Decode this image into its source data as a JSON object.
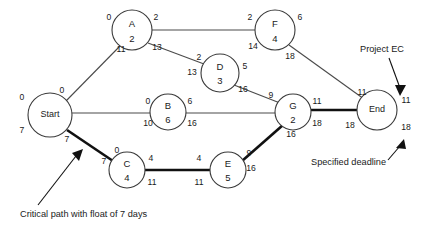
{
  "diagram": {
    "type": "activity-on-node-network",
    "nodes": [
      {
        "id": "start",
        "name": "Start",
        "duration": "",
        "cx": 50,
        "cy": 115,
        "r": 22,
        "early_start": "0",
        "early_finish": "0",
        "late_start": "7",
        "late_finish": "7",
        "corners": {
          "tl": "0",
          "tr": "0",
          "bl": "7",
          "br": "7"
        },
        "critical": true
      },
      {
        "id": "a",
        "name": "A",
        "duration": "2",
        "cx": 132,
        "cy": 30,
        "r": 20,
        "early_start": "0",
        "early_finish": "2",
        "late_start": "11",
        "late_finish": "13",
        "corners": {
          "tl": "0",
          "tr": "2",
          "bl": "11",
          "br": "13"
        },
        "critical": false
      },
      {
        "id": "b",
        "name": "B",
        "duration": "6",
        "cx": 168,
        "cy": 112,
        "r": 18,
        "early_start": "0",
        "early_finish": "6",
        "late_start": "10",
        "late_finish": "16",
        "corners": {
          "tl": "0",
          "tr": "6",
          "bl": "10",
          "br": "16"
        },
        "critical": false
      },
      {
        "id": "c",
        "name": "C",
        "duration": "4",
        "cx": 127,
        "cy": 170,
        "r": 18,
        "early_start": "0",
        "early_finish": "4",
        "late_start": "7",
        "late_finish": "11",
        "corners": {
          "tl": "0",
          "tr": "4",
          "bl": "7",
          "br": "11"
        },
        "critical": true
      },
      {
        "id": "d",
        "name": "D",
        "duration": "3",
        "cx": 220,
        "cy": 73,
        "r": 19,
        "early_start": "2",
        "early_finish": "5",
        "late_start": "13",
        "late_finish": "16",
        "corners": {
          "tl": "2",
          "tr": "5",
          "bl": "13",
          "br": "16"
        },
        "critical": false
      },
      {
        "id": "e",
        "name": "E",
        "duration": "5",
        "cx": 228,
        "cy": 170,
        "r": 18,
        "early_start": "4",
        "early_finish": "9",
        "late_start": "11",
        "late_finish": "16",
        "corners": {
          "tl": "4",
          "tr": "9",
          "bl": "11",
          "br": "16"
        },
        "critical": true
      },
      {
        "id": "f",
        "name": "F",
        "duration": "4",
        "cx": 275,
        "cy": 30,
        "r": 20,
        "early_start": "2",
        "early_finish": "6",
        "late_start": "14",
        "late_finish": "18",
        "corners": {
          "tl": "2",
          "tr": "6",
          "bl": "14",
          "br": "18"
        },
        "critical": false
      },
      {
        "id": "g",
        "name": "G",
        "duration": "2",
        "cx": 293,
        "cy": 112,
        "r": 18,
        "early_start": "9",
        "early_finish": "11",
        "late_start": "16",
        "late_finish": "18",
        "corners": {
          "tl": "9",
          "tr": "11",
          "bl": "16",
          "br": "18"
        },
        "critical": true
      },
      {
        "id": "end",
        "name": "End",
        "duration": "",
        "cx": 377,
        "cy": 110,
        "r": 20,
        "early_start": "11",
        "early_finish": "11",
        "late_start": "18",
        "late_finish": "18",
        "corners": {
          "tl": "11",
          "tr": "11",
          "bl": "18",
          "br": "18"
        },
        "critical": true
      }
    ],
    "edges": [
      {
        "from": "start",
        "to": "a",
        "critical": false
      },
      {
        "from": "start",
        "to": "b",
        "critical": false
      },
      {
        "from": "start",
        "to": "c",
        "critical": true
      },
      {
        "from": "a",
        "to": "f",
        "critical": false
      },
      {
        "from": "a",
        "to": "d",
        "critical": false
      },
      {
        "from": "d",
        "to": "g",
        "critical": false
      },
      {
        "from": "b",
        "to": "g",
        "critical": false
      },
      {
        "from": "c",
        "to": "e",
        "critical": true
      },
      {
        "from": "e",
        "to": "g",
        "critical": true
      },
      {
        "from": "f",
        "to": "end",
        "critical": false
      },
      {
        "from": "g",
        "to": "end",
        "critical": true
      }
    ],
    "annotations": [
      {
        "id": "project-ec",
        "text": "Project EC",
        "x": 360,
        "y": 50
      },
      {
        "id": "specified-deadline",
        "text": "Specified deadline",
        "x": 311,
        "y": 163
      },
      {
        "id": "critical-path",
        "text": "Critical path with float of 7 days",
        "x": 20,
        "y": 215
      }
    ],
    "colors": {
      "node_stroke": "#3a3a3a",
      "edge": "#4a4a4a",
      "critical_edge": "#111111",
      "text": "#1a1a1a",
      "background": "#ffffff"
    }
  }
}
